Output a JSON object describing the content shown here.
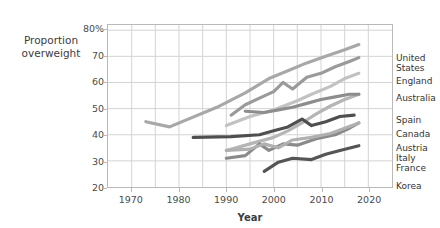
{
  "chart_data": {
    "type": "line",
    "title": "",
    "xlabel": "Year",
    "ylabel": "Proportion overweight",
    "ylabel_line1": "Proportion",
    "ylabel_line2": "overweight",
    "xlim": [
      1965,
      2025
    ],
    "ylim": [
      20,
      82
    ],
    "grid": true,
    "grid_x_step": 5,
    "grid_y_step": 10,
    "legend_position": "right",
    "xticks": [
      "1970",
      "1980",
      "1990",
      "2000",
      "2010",
      "2020"
    ],
    "xtick_values": [
      1970,
      1980,
      1990,
      2000,
      2010,
      2020
    ],
    "yticks": [
      "80%",
      "70",
      "60",
      "50",
      "40",
      "30",
      "20"
    ],
    "ytick_values": [
      80,
      70,
      60,
      50,
      40,
      30,
      20
    ],
    "series": [
      {
        "name": "United States",
        "color": "#a8a8a8",
        "label_top": 30,
        "x": [
          1973,
          1978,
          1988,
          1994,
          1999,
          2003,
          2007,
          2011,
          2015,
          2018
        ],
        "values": [
          45.0,
          43.0,
          50.5,
          56.0,
          61.5,
          64.5,
          67.5,
          70.0,
          72.5,
          74.5
        ]
      },
      {
        "name": "England",
        "color": "#9a9a9a",
        "label_top": 53,
        "x": [
          1991,
          1994,
          1997,
          2000,
          2002,
          2004,
          2007,
          2010,
          2013,
          2016,
          2018
        ],
        "values": [
          47.5,
          51.5,
          54.0,
          56.5,
          60.0,
          57.5,
          62.0,
          63.5,
          66.0,
          68.0,
          69.5
        ]
      },
      {
        "name": "Australia",
        "color": "#c2c2c2",
        "label_top": 70,
        "x": [
          1990,
          1995,
          2000,
          2005,
          2008,
          2012,
          2015,
          2018
        ],
        "values": [
          43.5,
          47.0,
          49.5,
          53.0,
          55.5,
          58.5,
          61.5,
          63.5
        ]
      },
      {
        "name": "Spain",
        "color": "#b5b5b5",
        "label_top": 92,
        "x": [
          1990,
          1995,
          2000,
          2003,
          2006,
          2009,
          2012,
          2015,
          2018
        ],
        "values": [
          34.0,
          36.5,
          39.0,
          41.5,
          44.5,
          48.0,
          51.0,
          53.5,
          55.5
        ]
      },
      {
        "name": "Canada",
        "color": "#8d8d8d",
        "label_top": 106,
        "x": [
          1994,
          1998,
          2001,
          2004,
          2007,
          2010,
          2013,
          2016,
          2018
        ],
        "values": [
          49.0,
          48.5,
          49.5,
          50.5,
          52.0,
          53.5,
          54.5,
          55.5,
          55.5
        ]
      },
      {
        "name": "Austria",
        "color": "#4f4f4f",
        "label_top": 120,
        "x": [
          1983,
          1991,
          1997,
          2000,
          2003,
          2006,
          2008,
          2011,
          2014,
          2017
        ],
        "values": [
          39.0,
          39.3,
          40.0,
          41.5,
          43.0,
          46.0,
          43.5,
          45.0,
          47.0,
          47.5
        ]
      },
      {
        "name": "Italy",
        "color": "#8a8a8a",
        "label_top": 130,
        "x": [
          1990,
          1994,
          1997,
          1999,
          2002,
          2005,
          2009,
          2013,
          2016,
          2018
        ],
        "values": [
          31.0,
          32.0,
          36.5,
          34.0,
          36.5,
          36.0,
          38.5,
          40.0,
          42.5,
          44.5
        ]
      },
      {
        "name": "France",
        "color": "#b0b0b0",
        "label_top": 140,
        "x": [
          1990,
          1995,
          1998,
          2001,
          2004,
          2008,
          2012,
          2015,
          2018
        ],
        "values": [
          34.0,
          34.5,
          36.5,
          35.0,
          38.0,
          39.0,
          40.5,
          42.5,
          44.5
        ]
      },
      {
        "name": "Korea",
        "color": "#555555",
        "label_top": 158,
        "x": [
          1998,
          2001,
          2004,
          2008,
          2011,
          2014,
          2018
        ],
        "values": [
          26.0,
          29.5,
          31.0,
          30.5,
          32.5,
          34.0,
          35.8
        ]
      }
    ]
  }
}
